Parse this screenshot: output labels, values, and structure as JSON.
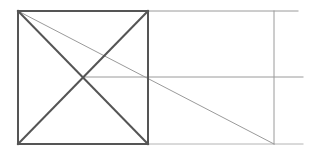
{
  "figure": {
    "width": 315,
    "height": 157,
    "background_color": "#ffffff"
  },
  "styles": {
    "primary_stroke_color": "#555555",
    "primary_stroke_width": 2,
    "construction_stroke_color": "#9a9a9a",
    "construction_stroke_width": 1,
    "faint_stroke_color": "#b4b4b4"
  },
  "points": {
    "square_top_left": {
      "x": 18,
      "y": 11
    },
    "square_top_right": {
      "x": 148,
      "y": 11
    },
    "square_bottom_right": {
      "x": 148,
      "y": 144
    },
    "square_bottom_left": {
      "x": 18,
      "y": 144
    },
    "square_center": {
      "x": 83,
      "y": 77
    },
    "vertical_guide_top": {
      "x": 274,
      "y": 11
    },
    "vertical_guide_bottom": {
      "x": 274,
      "y": 144
    },
    "top_guide_end": {
      "x": 298,
      "y": 11
    },
    "middle_guide_end": {
      "x": 303,
      "y": 77
    },
    "bottom_guide_end": {
      "x": 303,
      "y": 144
    }
  },
  "shapes": {
    "square": {
      "label": "square",
      "path": "M 18 11 L 148 11 L 148 144 L 18 144 Z",
      "color": "#555555",
      "width": 2
    },
    "diagonal_tl_br": {
      "label": "square-diagonal-top-left-to-bottom-right",
      "x1": 18,
      "y1": 11,
      "x2": 148,
      "y2": 144,
      "color": "#555555",
      "width": 2
    },
    "diagonal_tr_bl": {
      "label": "square-diagonal-top-right-to-bottom-left",
      "x1": 148,
      "y1": 11,
      "x2": 18,
      "y2": 144,
      "color": "#555555",
      "width": 2
    },
    "top_extension": {
      "label": "top-horizontal-extension",
      "x1": 148,
      "y1": 11,
      "x2": 298,
      "y2": 11,
      "color": "#9a9a9a",
      "width": 1
    },
    "bottom_extension": {
      "label": "bottom-horizontal-extension",
      "x1": 148,
      "y1": 144,
      "x2": 303,
      "y2": 144,
      "color": "#b4b4b4",
      "width": 1
    },
    "middle_horizontal": {
      "label": "middle-horizontal-from-center",
      "x1": 83,
      "y1": 77,
      "x2": 303,
      "y2": 77,
      "color": "#9a9a9a",
      "width": 1
    },
    "vertical_guide": {
      "label": "right-vertical-guide",
      "x1": 274,
      "y1": 11,
      "x2": 274,
      "y2": 144,
      "color": "#9a9a9a",
      "width": 1
    },
    "long_diagonal": {
      "label": "long-shallow-diagonal",
      "x1": 18,
      "y1": 11,
      "x2": 274,
      "y2": 144,
      "color": "#9a9a9a",
      "width": 1
    }
  }
}
